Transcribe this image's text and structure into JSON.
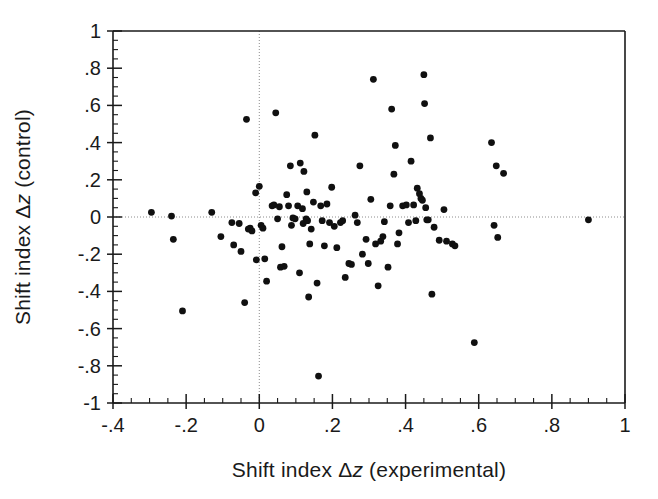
{
  "figure": {
    "background_color": "#ffffff",
    "point_color": "#101010",
    "axis_color": "#1a1a1a",
    "grid_color": "#8c8c8c"
  },
  "chart_data": {
    "type": "scatter",
    "title": "",
    "xlabel_prefix": "Shift index ",
    "xlabel_delta": "Δ",
    "xlabel_var": "z",
    "xlabel_suffix": " (experimental)",
    "xlabel": "Shift index Δz (experimental)",
    "ylabel_prefix": "Shift index ",
    "ylabel_delta": "Δ",
    "ylabel_var": "z",
    "ylabel_suffix": " (control)",
    "ylabel": "Shift index Δz (control)",
    "xlim": [
      -0.4,
      1.0
    ],
    "ylim": [
      -1.0,
      1.0
    ],
    "xticks": [
      -0.4,
      -0.2,
      0,
      0.2,
      0.4,
      0.6,
      0.8,
      1.0
    ],
    "xticklabels": [
      "-.4",
      "-.2",
      "0",
      ".2",
      ".4",
      ".6",
      ".8",
      "1"
    ],
    "yticks": [
      -1.0,
      -0.8,
      -0.6,
      -0.4,
      -0.2,
      0,
      0.2,
      0.4,
      0.6,
      0.8,
      1.0
    ],
    "yticklabels": [
      "-1",
      "-.8",
      "-.6",
      "-.4",
      "-.2",
      "0",
      ".2",
      ".4",
      ".6",
      ".8",
      "1"
    ],
    "x_minor_step": 0.05,
    "y_minor_step": 0.05,
    "grid": false,
    "zero_lines": {
      "x": 0,
      "y": 0,
      "style": "dotted"
    },
    "legend": null,
    "marker": "filled-circle",
    "marker_size_px": 6,
    "n_points": 117,
    "points": [
      [
        -0.295,
        0.025
      ],
      [
        -0.24,
        0.005
      ],
      [
        -0.235,
        -0.12
      ],
      [
        -0.21,
        -0.505
      ],
      [
        -0.13,
        0.025
      ],
      [
        -0.105,
        -0.105
      ],
      [
        -0.075,
        -0.03
      ],
      [
        -0.07,
        -0.15
      ],
      [
        -0.055,
        -0.035
      ],
      [
        -0.05,
        -0.185
      ],
      [
        -0.04,
        -0.46
      ],
      [
        -0.035,
        0.525
      ],
      [
        -0.03,
        -0.065
      ],
      [
        -0.025,
        -0.06
      ],
      [
        -0.02,
        -0.075
      ],
      [
        -0.01,
        0.13
      ],
      [
        -0.008,
        -0.23
      ],
      [
        0.0,
        0.165
      ],
      [
        0.005,
        -0.045
      ],
      [
        0.01,
        -0.06
      ],
      [
        0.015,
        -0.225
      ],
      [
        0.02,
        -0.345
      ],
      [
        0.035,
        0.06
      ],
      [
        0.04,
        0.065
      ],
      [
        0.045,
        0.56
      ],
      [
        0.05,
        -0.01
      ],
      [
        0.055,
        0.055
      ],
      [
        0.058,
        -0.27
      ],
      [
        0.062,
        -0.16
      ],
      [
        0.068,
        -0.265
      ],
      [
        0.075,
        0.12
      ],
      [
        0.08,
        0.06
      ],
      [
        0.085,
        0.275
      ],
      [
        0.088,
        -0.045
      ],
      [
        0.092,
        -0.005
      ],
      [
        0.098,
        -0.01
      ],
      [
        0.105,
        0.06
      ],
      [
        0.11,
        -0.3
      ],
      [
        0.112,
        0.29
      ],
      [
        0.118,
        0.045
      ],
      [
        0.12,
        -0.035
      ],
      [
        0.122,
        0.245
      ],
      [
        0.128,
        -0.01
      ],
      [
        0.13,
        0.135
      ],
      [
        0.132,
        -0.02
      ],
      [
        0.135,
        -0.43
      ],
      [
        0.138,
        -0.145
      ],
      [
        0.142,
        -0.065
      ],
      [
        0.148,
        0.08
      ],
      [
        0.152,
        0.44
      ],
      [
        0.158,
        -0.355
      ],
      [
        0.162,
        -0.855
      ],
      [
        0.168,
        0.06
      ],
      [
        0.172,
        -0.02
      ],
      [
        0.178,
        -0.155
      ],
      [
        0.185,
        0.07
      ],
      [
        0.192,
        -0.03
      ],
      [
        0.198,
        0.16
      ],
      [
        0.205,
        -0.05
      ],
      [
        0.212,
        -0.165
      ],
      [
        0.222,
        -0.03
      ],
      [
        0.228,
        -0.02
      ],
      [
        0.235,
        -0.325
      ],
      [
        0.245,
        -0.25
      ],
      [
        0.252,
        -0.255
      ],
      [
        0.262,
        0.01
      ],
      [
        0.268,
        -0.03
      ],
      [
        0.275,
        0.275
      ],
      [
        0.282,
        -0.2
      ],
      [
        0.292,
        -0.12
      ],
      [
        0.298,
        -0.25
      ],
      [
        0.305,
        0.095
      ],
      [
        0.312,
        0.74
      ],
      [
        0.318,
        -0.145
      ],
      [
        0.325,
        -0.37
      ],
      [
        0.332,
        -0.13
      ],
      [
        0.338,
        -0.105
      ],
      [
        0.342,
        -0.025
      ],
      [
        0.352,
        -0.27
      ],
      [
        0.358,
        0.06
      ],
      [
        0.362,
        0.58
      ],
      [
        0.368,
        0.23
      ],
      [
        0.372,
        0.385
      ],
      [
        0.378,
        -0.145
      ],
      [
        0.382,
        -0.085
      ],
      [
        0.392,
        0.06
      ],
      [
        0.402,
        0.065
      ],
      [
        0.408,
        -0.03
      ],
      [
        0.415,
        0.3
      ],
      [
        0.422,
        0.065
      ],
      [
        0.428,
        -0.02
      ],
      [
        0.432,
        0.155
      ],
      [
        0.438,
        0.125
      ],
      [
        0.442,
        0.1
      ],
      [
        0.446,
        0.09
      ],
      [
        0.45,
        0.765
      ],
      [
        0.452,
        0.61
      ],
      [
        0.455,
        0.05
      ],
      [
        0.458,
        -0.015
      ],
      [
        0.462,
        -0.015
      ],
      [
        0.468,
        0.425
      ],
      [
        0.472,
        -0.415
      ],
      [
        0.478,
        -0.055
      ],
      [
        0.492,
        -0.125
      ],
      [
        0.505,
        0.04
      ],
      [
        0.512,
        -0.13
      ],
      [
        0.528,
        -0.145
      ],
      [
        0.535,
        -0.155
      ],
      [
        0.588,
        -0.675
      ],
      [
        0.635,
        0.4
      ],
      [
        0.642,
        -0.045
      ],
      [
        0.648,
        0.275
      ],
      [
        0.652,
        -0.11
      ],
      [
        0.668,
        0.235
      ],
      [
        0.9,
        -0.015
      ]
    ]
  }
}
